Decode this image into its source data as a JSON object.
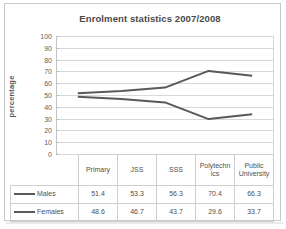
{
  "chart_data": {
    "type": "line",
    "title": "Enrolment statistics 2007/2008",
    "xlabel": "",
    "ylabel": "percentage",
    "ylim": [
      0,
      100
    ],
    "ytick_step": 10,
    "yticks": [
      "100",
      "90",
      "80",
      "70",
      "60",
      "50",
      "40",
      "30",
      "20",
      "10",
      "0"
    ],
    "grid": true,
    "legend_position": "data-table-left",
    "categories": [
      "Primary",
      "JSS",
      "SSS",
      "Polytechnics",
      "Public University"
    ],
    "categories_display": [
      "Primary",
      "JSS",
      "SSS",
      "Polytechn ics",
      "Public University"
    ],
    "series": [
      {
        "name": "Males",
        "color": "#595959",
        "values": [
          51.4,
          53.3,
          56.3,
          70.4,
          66.3
        ],
        "values_display": [
          "51.4",
          "53.3",
          "56.3",
          "70.4",
          "66.3"
        ]
      },
      {
        "name": "Females",
        "color": "#595959",
        "values": [
          48.6,
          46.7,
          43.7,
          29.6,
          33.7
        ],
        "values_display": [
          "48.6",
          "46.7",
          "43.7",
          "29.6",
          "33.7"
        ]
      }
    ]
  },
  "colors": {
    "series_line": "#595959",
    "gridline": "#d9d9d9",
    "border": "#c9c9c9",
    "text": "#4f4f4f",
    "title_text": "#4a4a4a"
  }
}
